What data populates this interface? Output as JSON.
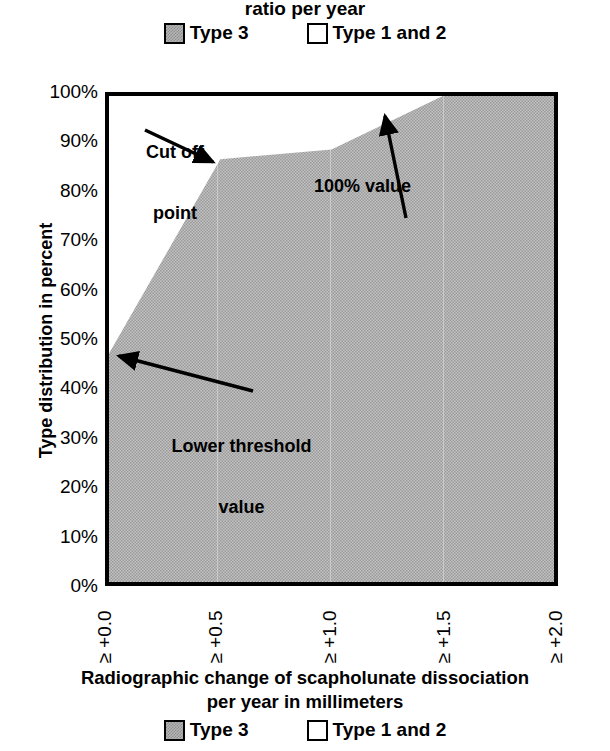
{
  "chart_data": {
    "type": "area",
    "title": "ratio per year",
    "xlabel": "Radiographic change of scapholunate dissociation per year in millimeters",
    "ylabel": "Type distribution in percent",
    "categories": [
      "≥ +0.0",
      "≥ +0.5",
      "≥ +1.0",
      "≥ +1.5",
      "≥ +2.0"
    ],
    "x": [
      0.0,
      0.5,
      1.0,
      1.5,
      2.0
    ],
    "series": [
      {
        "name": "Type 3",
        "values": [
          47,
          87,
          89,
          100,
          100
        ]
      },
      {
        "name": "Type 1 and 2",
        "values": [
          53,
          13,
          11,
          0,
          0
        ]
      }
    ],
    "ylim": [
      0,
      100
    ],
    "ytick_labels": [
      "100%",
      "90%",
      "80%",
      "70%",
      "60%",
      "50%",
      "40%",
      "30%",
      "20%",
      "10%",
      "0%"
    ],
    "ytick_values": [
      100,
      90,
      80,
      70,
      60,
      50,
      40,
      30,
      20,
      10,
      0
    ],
    "grid": false,
    "legend_position": "top-and-bottom-center",
    "annotations": [
      {
        "text": "Cut off\npoint",
        "points_to_x": 0.5,
        "points_to_y": 87
      },
      {
        "text": "100% value",
        "points_to_x": 1.5,
        "points_to_y": 100
      },
      {
        "text": "Lower threshold\nvalue",
        "points_to_x": 0.0,
        "points_to_y": 47
      }
    ],
    "colors": {
      "type3_fill": "#b5b5b5",
      "type12_fill": "#ffffff",
      "axis": "#000000"
    }
  },
  "top": {
    "title": "ratio per year"
  },
  "legend": {
    "entries": [
      {
        "label": "Type 3",
        "swatch": "gray-square-swatch"
      },
      {
        "label": "Type 1 and 2",
        "swatch": "white-square-swatch"
      }
    ]
  },
  "y_axis": {
    "title": "Type distribution in percent",
    "ticks": [
      "100%",
      "90%",
      "80%",
      "70%",
      "60%",
      "50%",
      "40%",
      "30%",
      "20%",
      "10%",
      "0%"
    ]
  },
  "x_axis": {
    "ticks": [
      "≥ +0.0",
      "≥ +0.5",
      "≥ +1.0",
      "≥ +1.5",
      "≥ +2.0"
    ],
    "title_line1": "Radiographic change of scapholunate dissociation",
    "title_line2": "per year in millimeters"
  },
  "annotations": {
    "cutoff_line1": "Cut off",
    "cutoff_line2": "point",
    "hundred_percent": "100% value",
    "lower_line1": "Lower threshold",
    "lower_line2": "value"
  }
}
